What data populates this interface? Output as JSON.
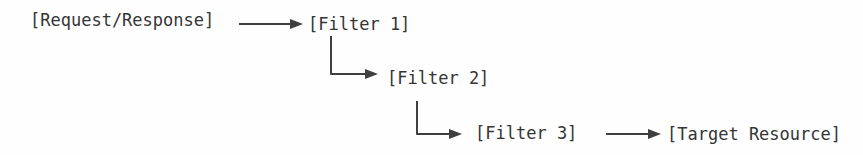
{
  "diagram": {
    "nodes": [
      {
        "id": "request-response",
        "label": "[Request/Response]"
      },
      {
        "id": "filter-1",
        "label": "[Filter 1]"
      },
      {
        "id": "filter-2",
        "label": "[Filter 2]"
      },
      {
        "id": "filter-3",
        "label": "[Filter 3]"
      },
      {
        "id": "target-resource",
        "label": "[Target Resource]"
      }
    ],
    "connectors": [
      {
        "from": "request-response",
        "to": "filter-1",
        "type": "straight-arrow"
      },
      {
        "from": "filter-1",
        "to": "filter-2",
        "type": "elbow-arrow"
      },
      {
        "from": "filter-2",
        "to": "filter-3",
        "type": "elbow-arrow"
      },
      {
        "from": "filter-3",
        "to": "target-resource",
        "type": "straight-arrow"
      }
    ],
    "colors": {
      "text": "#353535",
      "line": "#3f3f3f",
      "background": "#fefefe"
    }
  }
}
